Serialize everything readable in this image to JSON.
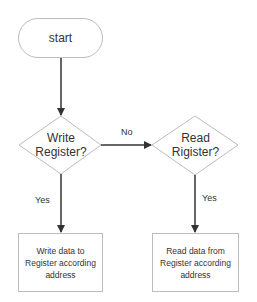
{
  "diagram": {
    "colors": {
      "stroke": "#bcbcbc",
      "arrow": "#333333",
      "text": "#333333",
      "background": "#ffffff"
    },
    "nodes": [
      {
        "id": "start",
        "type": "terminal",
        "label": "start"
      },
      {
        "id": "write_decision",
        "type": "decision",
        "label_line1": "Write",
        "label_line2": "Register?"
      },
      {
        "id": "read_decision",
        "type": "decision",
        "label_line1": "Read",
        "label_line2": "Rigister?"
      },
      {
        "id": "write_process",
        "type": "process",
        "label_line1": "Write data to",
        "label_line2": "Register according",
        "label_line3": "address"
      },
      {
        "id": "read_process",
        "type": "process",
        "label_line1": "Read data from",
        "label_line2": "Register according",
        "label_line3": "address"
      }
    ],
    "edges": [
      {
        "from": "start",
        "to": "write_decision",
        "label": ""
      },
      {
        "from": "write_decision",
        "to": "read_decision",
        "label": "No"
      },
      {
        "from": "write_decision",
        "to": "write_process",
        "label": "Yes"
      },
      {
        "from": "read_decision",
        "to": "read_process",
        "label": "Yes"
      }
    ]
  }
}
